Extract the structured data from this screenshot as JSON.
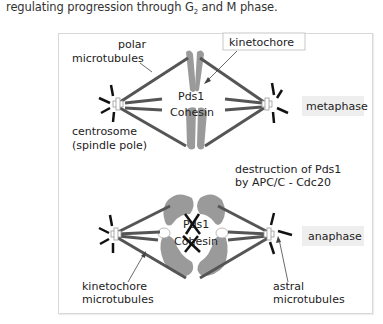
{
  "caption": {
    "prefix": "regulating progression through G",
    "subscript": "2",
    "suffix": " and M phase."
  },
  "diagram": {
    "top": {
      "label_polar_1": "polar",
      "label_polar_2": "microtubules",
      "label_kinetochore": "kinetochore",
      "label_pds1": "Pds1",
      "label_cohesin": "Cohesin",
      "label_centrosome_1": "centrosome",
      "label_centrosome_2": "(spindle pole)",
      "phase": "metaphase"
    },
    "middle": {
      "destruction_1": "destruction of Pds1",
      "destruction_2": "by APC/C - Cdc20"
    },
    "bottom": {
      "label_pds1": "Pds1",
      "label_cohesin": "Cohesin",
      "label_kinetochore_mt_1": "kinetochore",
      "label_kinetochore_mt_2": "microtubules",
      "label_astral_1": "astral",
      "label_astral_2": "microtubules",
      "phase": "anaphase"
    },
    "colors": {
      "microtubule": "#555555",
      "chromosome": "#9a9a9a",
      "phase_box": "#eeeeee",
      "astral": "#111111"
    }
  }
}
